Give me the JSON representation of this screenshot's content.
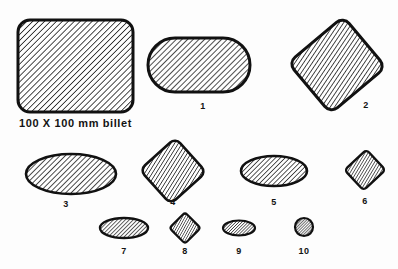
{
  "figure": {
    "background_color": "#fdfdfd",
    "line_color": "#111111",
    "hatch_color": "#111111",
    "billet_caption": "100 X 100 mm billet"
  },
  "chart_data": {
    "type": "diagram",
    "xlabel": "",
    "ylabel": "",
    "items": [
      {
        "label": "100 X 100 mm billet",
        "shape": "rounded-square",
        "cx": 75.5,
        "cy": 66,
        "rx": 57.5,
        "ry": 46,
        "corner": 12,
        "rotation": 0,
        "hatch_angle": 45,
        "hatch_spacing": 4.2,
        "hatch_width": 1.5,
        "stroke_width": 3.0,
        "label_x": 75.5,
        "label_y": 127,
        "label_size": 11,
        "is_caption": true
      },
      {
        "label": "1",
        "shape": "stadium",
        "cx": 199,
        "cy": 65,
        "rx": 51,
        "ry": 27,
        "rotation": 0,
        "hatch_angle": 45,
        "hatch_spacing": 4.0,
        "hatch_width": 1.5,
        "stroke_width": 3.0,
        "label_x": 203,
        "label_y": 109,
        "label_size": 9,
        "is_caption": false
      },
      {
        "label": "2",
        "shape": "rounded-square",
        "cx": 337,
        "cy": 65,
        "rx": 36,
        "ry": 33,
        "corner": 9,
        "rotation": -40,
        "hatch_angle": 74,
        "hatch_spacing": 3.6,
        "hatch_width": 1.5,
        "stroke_width": 3.0,
        "label_x": 366,
        "label_y": 108,
        "label_size": 9,
        "is_caption": false
      },
      {
        "label": "3",
        "shape": "ellipse",
        "cx": 71,
        "cy": 174,
        "rx": 45,
        "ry": 20,
        "rotation": 0,
        "hatch_angle": 45,
        "hatch_spacing": 3.8,
        "hatch_width": 1.5,
        "stroke_width": 2.6,
        "label_x": 66,
        "label_y": 207,
        "label_size": 9,
        "is_caption": false
      },
      {
        "label": "4",
        "shape": "rounded-square",
        "cx": 173,
        "cy": 171,
        "rx": 24,
        "ry": 23,
        "corner": 7,
        "rotation": -42,
        "hatch_angle": 74,
        "hatch_spacing": 3.2,
        "hatch_width": 1.4,
        "stroke_width": 2.6,
        "label_x": 173,
        "label_y": 205,
        "label_size": 9,
        "is_caption": false
      },
      {
        "label": "5",
        "shape": "ellipse",
        "cx": 274,
        "cy": 171,
        "rx": 33,
        "ry": 15,
        "rotation": 0,
        "hatch_angle": 45,
        "hatch_spacing": 3.4,
        "hatch_width": 1.4,
        "stroke_width": 2.6,
        "label_x": 274,
        "label_y": 205,
        "label_size": 9,
        "is_caption": false
      },
      {
        "label": "6",
        "shape": "rounded-square",
        "cx": 365,
        "cy": 170,
        "rx": 15,
        "ry": 14,
        "corner": 4,
        "rotation": -43,
        "hatch_angle": 74,
        "hatch_spacing": 2.6,
        "hatch_width": 1.3,
        "stroke_width": 2.4,
        "label_x": 365,
        "label_y": 204,
        "label_size": 9,
        "is_caption": false
      },
      {
        "label": "7",
        "shape": "ellipse",
        "cx": 124,
        "cy": 228,
        "rx": 24,
        "ry": 10,
        "rotation": 0,
        "hatch_angle": 45,
        "hatch_spacing": 2.8,
        "hatch_width": 1.3,
        "stroke_width": 2.4,
        "label_x": 124,
        "label_y": 254,
        "label_size": 9,
        "is_caption": false
      },
      {
        "label": "8",
        "shape": "rounded-square",
        "cx": 185,
        "cy": 228,
        "rx": 11,
        "ry": 11,
        "corner": 3,
        "rotation": -45,
        "hatch_angle": 74,
        "hatch_spacing": 2.3,
        "hatch_width": 1.2,
        "stroke_width": 2.2,
        "label_x": 185,
        "label_y": 254,
        "label_size": 9,
        "is_caption": false
      },
      {
        "label": "9",
        "shape": "ellipse",
        "cx": 239,
        "cy": 228,
        "rx": 16,
        "ry": 7.5,
        "rotation": 0,
        "hatch_angle": 45,
        "hatch_spacing": 2.2,
        "hatch_width": 1.2,
        "stroke_width": 2.2,
        "label_x": 239,
        "label_y": 254,
        "label_size": 9,
        "is_caption": false
      },
      {
        "label": "10",
        "shape": "circle",
        "cx": 304,
        "cy": 227,
        "rx": 9,
        "ry": 9,
        "rotation": 0,
        "hatch_angle": 45,
        "hatch_spacing": 2.0,
        "hatch_width": 1.2,
        "stroke_width": 2.2,
        "label_x": 304,
        "label_y": 254,
        "label_size": 9,
        "is_caption": false
      }
    ]
  }
}
